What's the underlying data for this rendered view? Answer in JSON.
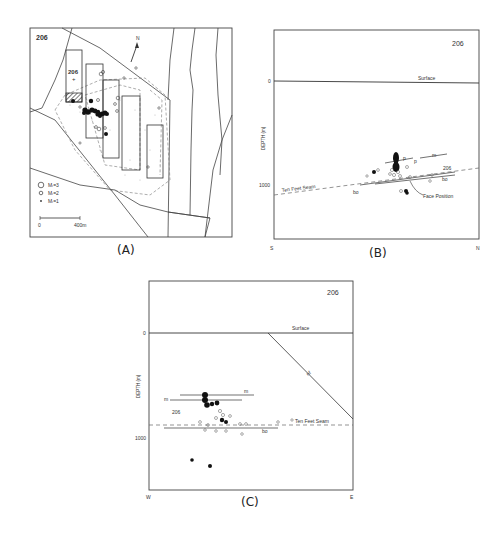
{
  "figure": {
    "panels": [
      {
        "id": "A",
        "caption": "(A)",
        "type": "plan-map",
        "panel_number": "206",
        "north_label": "N",
        "legend": [
          {
            "symbol": "large-circle",
            "label": "Mₗ=3"
          },
          {
            "symbol": "medium-circle",
            "label": "Mₗ=2"
          },
          {
            "symbol": "small-dot",
            "label": "Mₗ=1"
          }
        ],
        "scale_bar": {
          "start": "0",
          "end": "400m"
        },
        "panel_label_inner": "206"
      },
      {
        "id": "B",
        "caption": "(B)",
        "type": "cross-section",
        "panel_number": "206",
        "y_axis_label": "DEPTH (m)",
        "y_ticks": [
          "0",
          "1000"
        ],
        "x_left": "S",
        "x_right": "N",
        "annotations": [
          "Surface",
          "Ten Feet Seam",
          "m",
          "p",
          "p",
          "206",
          "bo",
          "bo",
          "Face Position"
        ]
      },
      {
        "id": "C",
        "caption": "(C)",
        "type": "cross-section",
        "panel_number": "206",
        "y_axis_label": "DEPTH (m)",
        "y_ticks": [
          "0",
          "1000"
        ],
        "x_left": "W",
        "x_right": "E",
        "annotations": [
          "Surface",
          "nf",
          "m",
          "m",
          "206",
          "Ten Feet Seam",
          "bo"
        ]
      }
    ]
  },
  "labels": {
    "a_num": "206",
    "a_inner": "206",
    "a_north": "N",
    "a_leg1": "Mₗ=3",
    "a_leg2": "Mₗ=2",
    "a_leg3": "Mₗ=1",
    "a_scale0": "0",
    "a_scale1": "400m",
    "a_cap": "(A)",
    "b_num": "206",
    "b_surface": "Surface",
    "b_y0": "0",
    "b_y1000": "1000",
    "b_ylabel": "DEPTH (m)",
    "b_seam": "Ten Feet Seam",
    "b_m": "m",
    "b_p1": "p",
    "b_p2": "p",
    "b_206": "206",
    "b_bo1": "bo",
    "b_bo2": "bo",
    "b_face": "Face Position",
    "b_s": "S",
    "b_n": "N",
    "b_cap": "(B)",
    "c_num": "206",
    "c_surface": "Surface",
    "c_y0": "0",
    "c_y1000": "1000",
    "c_ylabel": "DEPTH (m)",
    "c_nf": "nf",
    "c_m1": "m",
    "c_m2": "m",
    "c_206": "206",
    "c_seam": "Ten Feet Seam",
    "c_bo": "bo",
    "c_w": "W",
    "c_e": "E",
    "c_cap": "(C)"
  },
  "colors": {
    "ink": "#333333",
    "light": "#999999",
    "fill": "#111111"
  }
}
